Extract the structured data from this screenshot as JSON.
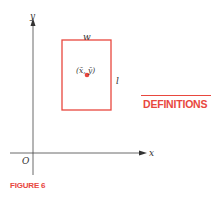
{
  "diagram": {
    "axes": {
      "x_label": "x",
      "y_label": "y",
      "origin_label": "O"
    },
    "rectangle": {
      "width_label": "w",
      "length_label": "l",
      "centroid_label": "(x̄, ȳ)",
      "color": "#e8473e"
    },
    "caption": "FIGURE 6"
  },
  "sidebar": {
    "heading": "DEFINITIONS"
  },
  "colors": {
    "accent": "#e8473e",
    "axis": "#333333"
  }
}
